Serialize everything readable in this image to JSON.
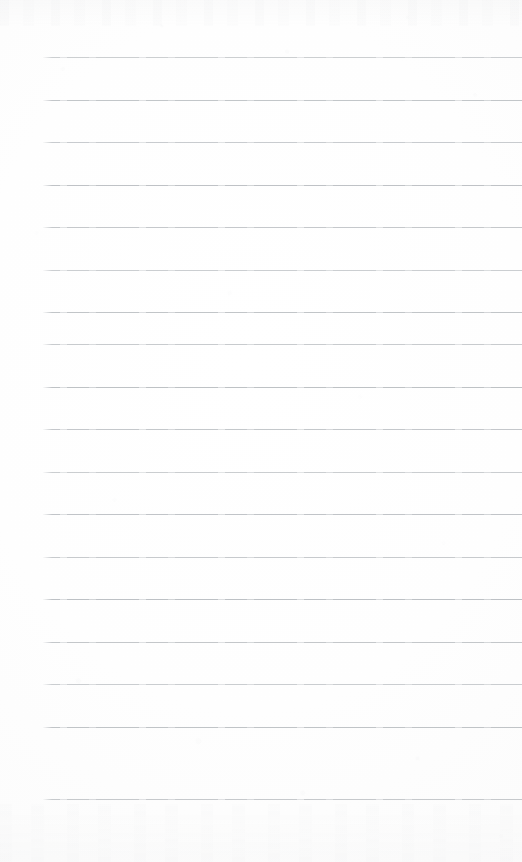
{
  "page": {
    "kind": "blank-ruled-notebook-page",
    "width": 522,
    "height": 862,
    "background_color": "#fdfdfd",
    "has_text": false,
    "has_margin_rule": false,
    "text_content": ""
  },
  "ruling": {
    "line_color": "#b9bdc1",
    "line_thickness": 1,
    "line_left_x": 43,
    "line_right_x": 522,
    "line_count": 18,
    "line_spacing": 42.5,
    "first_line_y": 57,
    "last_line_y": 799,
    "line_y_positions": [
      57,
      99.5,
      142,
      184.5,
      227,
      269.5,
      312,
      344,
      386.5,
      429,
      471.5,
      514,
      556.5,
      599,
      641.5,
      684,
      726.5,
      799
    ]
  }
}
